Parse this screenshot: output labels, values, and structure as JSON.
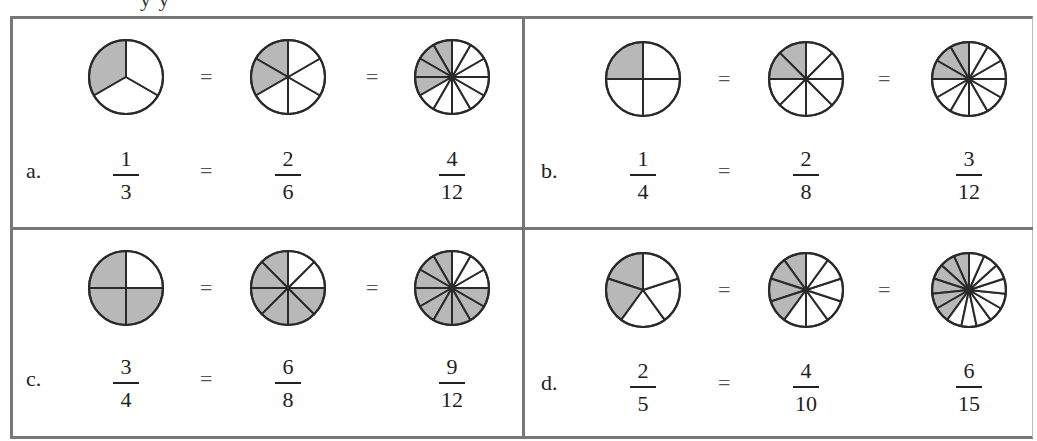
{
  "heading_fragment": "y   y",
  "colors": {
    "shade": "#b8b8b8",
    "stroke": "#2a2a2a",
    "frame": "#777777"
  },
  "equals_sign": "=",
  "problems": [
    {
      "label": "a.",
      "circles": [
        {
          "parts": 3,
          "shaded": 1
        },
        {
          "parts": 6,
          "shaded": 2
        },
        {
          "parts": 12,
          "shaded": 4
        }
      ],
      "fractions": [
        {
          "num": "1",
          "den": "3"
        },
        {
          "num": "2",
          "den": "6"
        },
        {
          "num": "4",
          "den": "12"
        }
      ]
    },
    {
      "label": "b.",
      "circles": [
        {
          "parts": 4,
          "shaded": 1
        },
        {
          "parts": 8,
          "shaded": 2
        },
        {
          "parts": 12,
          "shaded": 3
        }
      ],
      "fractions": [
        {
          "num": "1",
          "den": "4"
        },
        {
          "num": "2",
          "den": "8"
        },
        {
          "num": "3",
          "den": "12"
        }
      ]
    },
    {
      "label": "c.",
      "circles": [
        {
          "parts": 4,
          "shaded": 3
        },
        {
          "parts": 8,
          "shaded": 6
        },
        {
          "parts": 12,
          "shaded": 9
        }
      ],
      "fractions": [
        {
          "num": "3",
          "den": "4"
        },
        {
          "num": "6",
          "den": "8"
        },
        {
          "num": "9",
          "den": "12"
        }
      ]
    },
    {
      "label": "d.",
      "circles": [
        {
          "parts": 5,
          "shaded": 2
        },
        {
          "parts": 10,
          "shaded": 4
        },
        {
          "parts": 15,
          "shaded": 6
        }
      ],
      "fractions": [
        {
          "num": "2",
          "den": "5"
        },
        {
          "num": "4",
          "den": "10"
        },
        {
          "num": "6",
          "den": "15"
        }
      ]
    }
  ]
}
